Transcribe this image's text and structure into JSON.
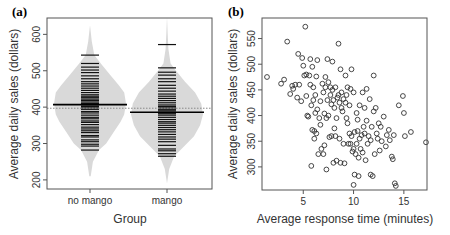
{
  "colors": {
    "axis": "#555555",
    "violin_fill": "#d9d9d9",
    "bean_line": "#111111",
    "overall_mean": "#888888",
    "point_stroke": "#333333"
  },
  "chart_data": [
    {
      "panel": "(a)",
      "type": "violin",
      "title": "",
      "xlabel": "Group",
      "ylabel": "Average daily sales (dollars)",
      "categories": [
        "no mango",
        "mango"
      ],
      "ylim": [
        175,
        645
      ],
      "yticks": [
        200,
        300,
        400,
        500,
        600
      ],
      "overall_mean": 397,
      "series": [
        {
          "name": "no mango",
          "mean": 407,
          "min": 282,
          "max": 543,
          "tail_low": 210,
          "tail_high": 625,
          "profile": [
            [
              210,
              0.02
            ],
            [
              250,
              0.08
            ],
            [
              282,
              0.25
            ],
            [
              300,
              0.45
            ],
            [
              330,
              0.65
            ],
            [
              360,
              0.85
            ],
            [
              380,
              0.95
            ],
            [
              410,
              1.0
            ],
            [
              440,
              0.95
            ],
            [
              460,
              0.8
            ],
            [
              490,
              0.55
            ],
            [
              520,
              0.3
            ],
            [
              543,
              0.12
            ],
            [
              580,
              0.05
            ],
            [
              625,
              0.0
            ]
          ],
          "values": [
            282,
            293,
            298,
            305,
            310,
            318,
            322,
            330,
            335,
            340,
            345,
            352,
            358,
            362,
            368,
            372,
            378,
            384,
            388,
            394,
            398,
            402,
            406,
            410,
            414,
            418,
            422,
            426,
            430,
            434,
            440,
            446,
            452,
            458,
            464,
            470,
            478,
            486,
            495,
            502,
            510,
            520,
            543
          ]
        },
        {
          "name": "mango",
          "mean": 386,
          "min": 265,
          "max": 572,
          "tail_low": 190,
          "tail_high": 648,
          "profile": [
            [
              190,
              0.0
            ],
            [
              230,
              0.06
            ],
            [
              265,
              0.2
            ],
            [
              290,
              0.45
            ],
            [
              320,
              0.75
            ],
            [
              350,
              0.92
            ],
            [
              380,
              1.0
            ],
            [
              410,
              0.95
            ],
            [
              440,
              0.78
            ],
            [
              470,
              0.5
            ],
            [
              500,
              0.25
            ],
            [
              520,
              0.1
            ],
            [
              560,
              0.04
            ],
            [
              600,
              0.02
            ],
            [
              648,
              0.0
            ]
          ],
          "values": [
            265,
            272,
            280,
            285,
            295,
            305,
            312,
            318,
            325,
            332,
            338,
            344,
            350,
            356,
            360,
            366,
            372,
            378,
            382,
            386,
            390,
            394,
            398,
            402,
            406,
            412,
            418,
            424,
            430,
            436,
            444,
            452,
            460,
            470,
            478,
            488,
            496,
            508,
            572
          ]
        }
      ]
    },
    {
      "panel": "(b)",
      "type": "scatter",
      "title": "",
      "xlabel": "Average response time (minutes)",
      "ylabel": "Average daily sales (dollars)",
      "xlim": [
        0.9,
        17.3
      ],
      "ylim": [
        255,
        590
      ],
      "xticks": [
        5,
        10,
        15
      ],
      "yticks": [
        300,
        350,
        400,
        450,
        500,
        550
      ],
      "points": [
        [
          1.4,
          475
        ],
        [
          2.8,
          462
        ],
        [
          3.1,
          470
        ],
        [
          3.4,
          544
        ],
        [
          3.7,
          442
        ],
        [
          3.9,
          458
        ],
        [
          4.0,
          452
        ],
        [
          4.2,
          460
        ],
        [
          4.4,
          435
        ],
        [
          4.5,
          520
        ],
        [
          4.6,
          460
        ],
        [
          4.8,
          428
        ],
        [
          4.9,
          512
        ],
        [
          5.0,
          497
        ],
        [
          5.1,
          478
        ],
        [
          5.2,
          573
        ],
        [
          5.3,
          438
        ],
        [
          5.3,
          480
        ],
        [
          5.4,
          400
        ],
        [
          5.5,
          398
        ],
        [
          5.6,
          478
        ],
        [
          5.7,
          460
        ],
        [
          5.7,
          510
        ],
        [
          5.8,
          302
        ],
        [
          5.8,
          420
        ],
        [
          5.9,
          495
        ],
        [
          5.9,
          372
        ],
        [
          6.0,
          455
        ],
        [
          6.0,
          430
        ],
        [
          6.1,
          355
        ],
        [
          6.1,
          370
        ],
        [
          6.2,
          440
        ],
        [
          6.2,
          405
        ],
        [
          6.3,
          365
        ],
        [
          6.3,
          476
        ],
        [
          6.4,
          508
        ],
        [
          6.4,
          412
        ],
        [
          6.5,
          325
        ],
        [
          6.6,
          395
        ],
        [
          6.7,
          382
        ],
        [
          6.7,
          428
        ],
        [
          6.8,
          335
        ],
        [
          6.9,
          462
        ],
        [
          7.0,
          445
        ],
        [
          7.0,
          325
        ],
        [
          7.1,
          404
        ],
        [
          7.1,
          342
        ],
        [
          7.2,
          475
        ],
        [
          7.2,
          455
        ],
        [
          7.3,
          395
        ],
        [
          7.3,
          295
        ],
        [
          7.4,
          510
        ],
        [
          7.4,
          430
        ],
        [
          7.5,
          465
        ],
        [
          7.5,
          400
        ],
        [
          7.6,
          358
        ],
        [
          7.7,
          440
        ],
        [
          7.7,
          455
        ],
        [
          7.8,
          422
        ],
        [
          7.8,
          360
        ],
        [
          7.9,
          505
        ],
        [
          7.9,
          450
        ],
        [
          8.0,
          430
        ],
        [
          8.0,
          308
        ],
        [
          8.1,
          375
        ],
        [
          8.1,
          415
        ],
        [
          8.2,
          455
        ],
        [
          8.2,
          360
        ],
        [
          8.3,
          312
        ],
        [
          8.3,
          395
        ],
        [
          8.4,
          435
        ],
        [
          8.5,
          440
        ],
        [
          8.5,
          540
        ],
        [
          8.6,
          355
        ],
        [
          8.6,
          425
        ],
        [
          8.7,
          308
        ],
        [
          8.7,
          490
        ],
        [
          8.8,
          445
        ],
        [
          8.8,
          415
        ],
        [
          8.9,
          408
        ],
        [
          9.0,
          345
        ],
        [
          9.0,
          432
        ],
        [
          9.1,
          307
        ],
        [
          9.2,
          478
        ],
        [
          9.2,
          425
        ],
        [
          9.3,
          440
        ],
        [
          9.3,
          395
        ],
        [
          9.4,
          455
        ],
        [
          9.4,
          385
        ],
        [
          9.5,
          345
        ],
        [
          9.6,
          420
        ],
        [
          9.6,
          365
        ],
        [
          9.7,
          452
        ],
        [
          9.7,
          345
        ],
        [
          9.8,
          490
        ],
        [
          9.8,
          360
        ],
        [
          9.9,
          330
        ],
        [
          10.0,
          445
        ],
        [
          10.0,
          265
        ],
        [
          10.0,
          335
        ],
        [
          10.1,
          368
        ],
        [
          10.1,
          285
        ],
        [
          10.2,
          325
        ],
        [
          10.3,
          405
        ],
        [
          10.3,
          345
        ],
        [
          10.4,
          392
        ],
        [
          10.4,
          370
        ],
        [
          10.5,
          282
        ],
        [
          10.5,
          318
        ],
        [
          10.6,
          355
        ],
        [
          10.6,
          420
        ],
        [
          10.7,
          335
        ],
        [
          10.8,
          362
        ],
        [
          10.9,
          445
        ],
        [
          10.9,
          328
        ],
        [
          11.0,
          378
        ],
        [
          11.1,
          365
        ],
        [
          11.1,
          415
        ],
        [
          11.2,
          313
        ],
        [
          11.3,
          390
        ],
        [
          11.3,
          452
        ],
        [
          11.4,
          345
        ],
        [
          11.5,
          360
        ],
        [
          11.6,
          432
        ],
        [
          11.7,
          285
        ],
        [
          11.7,
          352
        ],
        [
          11.8,
          378
        ],
        [
          11.9,
          282
        ],
        [
          12.0,
          408
        ],
        [
          12.0,
          478
        ],
        [
          12.1,
          325
        ],
        [
          12.2,
          415
        ],
        [
          12.3,
          365
        ],
        [
          12.4,
          355
        ],
        [
          12.5,
          385
        ],
        [
          12.6,
          332
        ],
        [
          12.7,
          378
        ],
        [
          12.8,
          350
        ],
        [
          13.0,
          398
        ],
        [
          13.2,
          340
        ],
        [
          13.3,
          362
        ],
        [
          13.5,
          372
        ],
        [
          13.6,
          352
        ],
        [
          13.8,
          320
        ],
        [
          13.9,
          315
        ],
        [
          14.0,
          362
        ],
        [
          14.1,
          268
        ],
        [
          14.2,
          263
        ],
        [
          14.5,
          420
        ],
        [
          14.9,
          438
        ],
        [
          15.0,
          405
        ],
        [
          15.1,
          360
        ],
        [
          15.7,
          368
        ],
        [
          17.2,
          348
        ]
      ]
    }
  ]
}
